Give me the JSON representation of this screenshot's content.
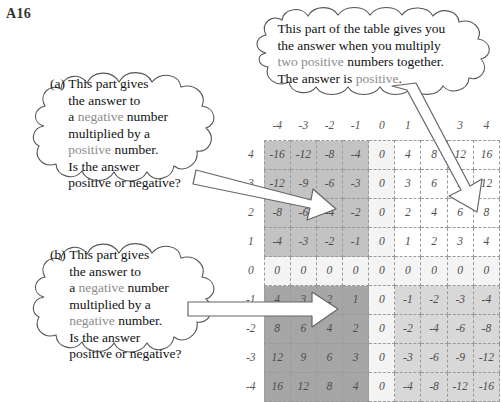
{
  "worksheet": {
    "corner_label": "A16"
  },
  "callouts": {
    "top": {
      "id": "positive-times-positive",
      "marker": "",
      "lines": [
        [
          {
            "t": "This part of the table gives you",
            "c": "normal"
          }
        ],
        [
          {
            "t": "the answer when you multiply",
            "c": "normal"
          }
        ],
        [
          {
            "t": "two positive",
            "c": "highlight"
          },
          {
            "t": " numbers together.",
            "c": "normal"
          }
        ],
        [
          {
            "t": "The answer is ",
            "c": "normal"
          },
          {
            "t": "positive",
            "c": "highlight"
          },
          {
            "t": ".",
            "c": "normal"
          }
        ]
      ]
    },
    "a": {
      "id": "negative-times-positive",
      "marker": "(a)",
      "lines": [
        [
          {
            "t": "This part gives",
            "c": "normal"
          }
        ],
        [
          {
            "t": "the answer to",
            "c": "normal"
          }
        ],
        [
          {
            "t": "a ",
            "c": "normal"
          },
          {
            "t": "negative",
            "c": "highlight"
          },
          {
            "t": " number",
            "c": "normal"
          }
        ],
        [
          {
            "t": "multiplied by a",
            "c": "normal"
          }
        ],
        [
          {
            "t": "positive",
            "c": "highlight"
          },
          {
            "t": " number.",
            "c": "normal"
          }
        ],
        [
          {
            "t": "Is the answer",
            "c": "normal"
          }
        ],
        [
          {
            "t": "positive or negative?",
            "c": "normal"
          }
        ]
      ]
    },
    "b": {
      "id": "negative-times-negative",
      "marker": "(b)",
      "lines": [
        [
          {
            "t": "This part gives",
            "c": "normal"
          }
        ],
        [
          {
            "t": "the answer to",
            "c": "normal"
          }
        ],
        [
          {
            "t": "a ",
            "c": "normal"
          },
          {
            "t": "negative",
            "c": "highlight"
          },
          {
            "t": " number",
            "c": "normal"
          }
        ],
        [
          {
            "t": "multiplied by a",
            "c": "normal"
          }
        ],
        [
          {
            "t": "negative",
            "c": "highlight"
          },
          {
            "t": " number.",
            "c": "normal"
          }
        ],
        [
          {
            "t": "Is the answer",
            "c": "normal"
          }
        ],
        [
          {
            "t": "positive or negative?",
            "c": "normal"
          }
        ]
      ]
    }
  },
  "chart_data": {
    "type": "table",
    "xlabel": "",
    "ylabel": "",
    "column_headers": [
      "-4",
      "-3",
      "-2",
      "-1",
      "0",
      "1",
      "2",
      "3",
      "4"
    ],
    "row_headers": [
      "4",
      "3",
      "2",
      "1",
      "0",
      "-1",
      "-2",
      "-3",
      "-4"
    ],
    "rows": [
      {
        "header": "4",
        "values": [
          "-16",
          "-12",
          "-8",
          "-4",
          "0",
          "4",
          "8",
          "12",
          "16"
        ]
      },
      {
        "header": "3",
        "values": [
          "-12",
          "-9",
          "-6",
          "-3",
          "0",
          "3",
          "6",
          "9",
          "12"
        ]
      },
      {
        "header": "2",
        "values": [
          "-8",
          "-6",
          "-4",
          "-2",
          "0",
          "2",
          "4",
          "6",
          "8"
        ]
      },
      {
        "header": "1",
        "values": [
          "-4",
          "-3",
          "-2",
          "-1",
          "0",
          "1",
          "2",
          "3",
          "4"
        ]
      },
      {
        "header": "0",
        "values": [
          "0",
          "0",
          "0",
          "0",
          "0",
          "0",
          "0",
          "0",
          "0"
        ]
      },
      {
        "header": "-1",
        "values": [
          "4",
          "3",
          "2",
          "1",
          "0",
          "-1",
          "-2",
          "-3",
          "-4"
        ]
      },
      {
        "header": "-2",
        "values": [
          "8",
          "6",
          "4",
          "2",
          "0",
          "-2",
          "-4",
          "-6",
          "-8"
        ]
      },
      {
        "header": "-3",
        "values": [
          "12",
          "9",
          "6",
          "3",
          "0",
          "-3",
          "-6",
          "-9",
          "-12"
        ]
      },
      {
        "header": "-4",
        "values": [
          "16",
          "12",
          "8",
          "4",
          "0",
          "-4",
          "-8",
          "-12",
          "-16"
        ]
      }
    ],
    "quadrant_shading": {
      "negative_times_positive": "#c3c3c3",
      "positive_times_positive": "#ffffff",
      "negative_times_negative": "#a6a6a6",
      "positive_times_negative": "#d8d8d8",
      "zero_row_and_column": "#f4f4f4"
    },
    "grid": true,
    "legend": "none"
  },
  "colors": {
    "highlight_word": "#8c8c8c",
    "text": "#111111",
    "table_text": "#4d4d4d",
    "grid_line": "#9a9a9a",
    "frame_line": "#4a4a4a",
    "arrow_fill": "#ffffff",
    "arrow_stroke": "#555555",
    "cloud_stroke": "#555555"
  }
}
